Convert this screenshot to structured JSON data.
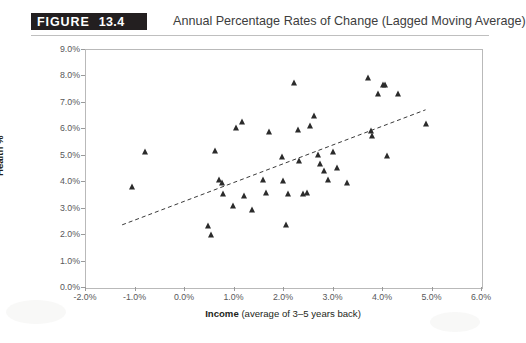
{
  "figure": {
    "badge_word": "FIGURE",
    "badge_number": "13.4",
    "title": "Annual Percentage Rates of Change (Lagged Moving Average)"
  },
  "chart_data": {
    "type": "scatter",
    "title": "Annual Percentage Rates of Change (Lagged Moving Average)",
    "xlabel_strong": "Income",
    "xlabel_rest": " (average of 3–5 years back)",
    "xlabel": "Income (average of 3–5 years back)",
    "ylabel": "Health %",
    "xlim": [
      -2.0,
      6.0
    ],
    "ylim": [
      0.0,
      9.0
    ],
    "xticks": [
      "-2.0%",
      "-1.0%",
      "0.0%",
      "1.0%",
      "2.0%",
      "3.0%",
      "4.0%",
      "5.0%",
      "6.0%"
    ],
    "xtick_values": [
      -2.0,
      -1.0,
      0.0,
      1.0,
      2.0,
      3.0,
      4.0,
      5.0,
      6.0
    ],
    "yticks": [
      "0.0%",
      "1.0%",
      "2.0%",
      "3.0%",
      "4.0%",
      "5.0%",
      "6.0%",
      "7.0%",
      "8.0%",
      "9.0%"
    ],
    "ytick_values": [
      0.0,
      1.0,
      2.0,
      3.0,
      4.0,
      5.0,
      6.0,
      7.0,
      8.0,
      9.0
    ],
    "grid": false,
    "legend": null,
    "marker_shape": "triangle",
    "marker_color": "#2b2b2b",
    "points": [
      [
        -0.79,
        5.1
      ],
      [
        -1.05,
        3.8
      ],
      [
        0.48,
        2.3
      ],
      [
        0.55,
        1.98
      ],
      [
        0.62,
        5.15
      ],
      [
        0.7,
        4.05
      ],
      [
        0.76,
        3.95
      ],
      [
        0.78,
        3.5
      ],
      [
        0.98,
        3.05
      ],
      [
        1.05,
        6.0
      ],
      [
        1.18,
        6.25
      ],
      [
        1.22,
        3.45
      ],
      [
        1.38,
        2.9
      ],
      [
        1.6,
        4.05
      ],
      [
        1.66,
        3.55
      ],
      [
        1.72,
        5.85
      ],
      [
        1.98,
        4.9
      ],
      [
        2.0,
        4.0
      ],
      [
        2.06,
        2.35
      ],
      [
        2.1,
        3.5
      ],
      [
        2.22,
        7.7
      ],
      [
        2.3,
        5.95
      ],
      [
        2.32,
        4.75
      ],
      [
        2.4,
        3.5
      ],
      [
        2.48,
        3.55
      ],
      [
        2.55,
        6.1
      ],
      [
        2.62,
        6.45
      ],
      [
        2.7,
        5.0
      ],
      [
        2.74,
        4.65
      ],
      [
        2.82,
        4.4
      ],
      [
        2.9,
        4.05
      ],
      [
        3.02,
        5.1
      ],
      [
        3.1,
        4.5
      ],
      [
        3.3,
        3.95
      ],
      [
        3.72,
        7.9
      ],
      [
        3.78,
        5.9
      ],
      [
        3.8,
        5.7
      ],
      [
        3.92,
        7.3
      ],
      [
        4.02,
        7.65
      ],
      [
        4.06,
        7.65
      ],
      [
        4.1,
        4.95
      ],
      [
        4.32,
        7.3
      ],
      [
        4.88,
        6.15
      ]
    ],
    "trendline": {
      "type": "linear_dashed",
      "x_start": -1.25,
      "y_start": 2.35,
      "x_end": 4.88,
      "y_end": 6.7,
      "style": "dashed",
      "color": "#3a3a3a"
    }
  }
}
